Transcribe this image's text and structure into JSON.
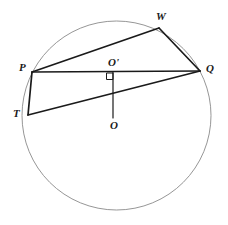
{
  "figure": {
    "width": 228,
    "height": 225,
    "background_color": "#ffffff",
    "stroke_color": "#1a1a1a",
    "circle_stroke_color": "#8a8a8a"
  },
  "circle": {
    "label": "main-circle",
    "center_x": 116.5,
    "center_y": 115.5,
    "radius": 94.5,
    "stroke_width": 0.9
  },
  "points": [
    {
      "id": "W",
      "label": "W",
      "x": 159,
      "y": 28,
      "label_x": 156,
      "label_y": 11
    },
    {
      "id": "P",
      "label": "P",
      "x": 32,
      "y": 72,
      "label_x": 19,
      "label_y": 62
    },
    {
      "id": "Q",
      "label": "Q",
      "x": 200,
      "y": 71,
      "label_x": 206,
      "label_y": 63
    },
    {
      "id": "O'",
      "label": "O'",
      "x": 113,
      "y": 72,
      "label_x": 108,
      "label_y": 57
    },
    {
      "id": "O",
      "label": "O",
      "x": 113,
      "y": 118,
      "label_x": 110,
      "label_y": 120
    },
    {
      "id": "T",
      "label": "T",
      "x": 28,
      "y": 115,
      "label_x": 13,
      "label_y": 108
    }
  ],
  "segments": [
    {
      "id": "PW",
      "from": "P",
      "to": "W",
      "stroke_width": 1.7
    },
    {
      "id": "WQ",
      "from": "W",
      "to": "Q",
      "stroke_width": 1.7
    },
    {
      "id": "PQ",
      "from": "P",
      "to": "Q",
      "stroke_width": 1.7
    },
    {
      "id": "PT",
      "from": "P",
      "to": "T",
      "stroke_width": 1.7
    },
    {
      "id": "TQ",
      "from": "T",
      "to": "Q",
      "stroke_width": 1.7
    },
    {
      "id": "OO-prime",
      "from": "O'",
      "to": "O",
      "stroke_width": 1.2
    }
  ],
  "right_angle_mark": {
    "id": "right-angle-at-O-prime",
    "x": 110,
    "y": 73,
    "size": 7,
    "stroke_width": 1.0,
    "description": "square marker indicating OO' is perpendicular to PQ"
  }
}
